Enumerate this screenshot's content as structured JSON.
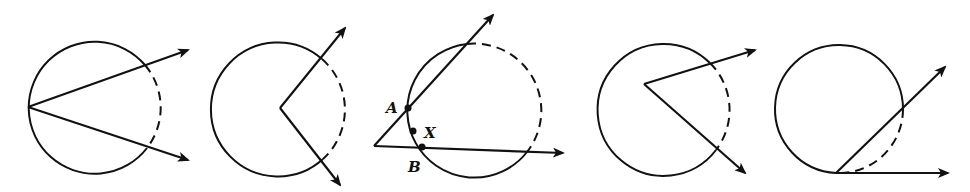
{
  "figures": [
    {
      "id": "fig1",
      "description": "vertex on circle, two chords extended as rays, intercepted arc dashed",
      "circle": {
        "cx": 93,
        "cy": 107,
        "r": 66
      },
      "vertex": [
        28,
        107
      ],
      "rays": [
        [
          188,
          50
        ],
        [
          188,
          160
        ]
      ],
      "dashed_arc": {
        "from": [
          145,
          65
        ],
        "to": [
          147,
          148
        ],
        "sweep": 1,
        "large": 0
      },
      "solid_arc": {
        "from": [
          147,
          148
        ],
        "to": [
          145,
          65
        ],
        "sweep": 1,
        "large": 1
      },
      "labels": []
    },
    {
      "id": "fig2",
      "description": "vertex at center-ish inside circle, rays exit right, intercepted arc dashed",
      "circle": {
        "cx": 279,
        "cy": 109,
        "r": 67
      },
      "vertex": [
        280,
        108
      ],
      "rays": [
        [
          345,
          28
        ],
        [
          340,
          185
        ]
      ],
      "dashed_arc": {
        "from": [
          322,
          59
        ],
        "to": [
          323,
          159
        ],
        "sweep": 1,
        "large": 0
      },
      "solid_arc": {
        "from": [
          323,
          159
        ],
        "to": [
          322,
          59
        ],
        "sweep": 1,
        "large": 1
      },
      "labels": []
    },
    {
      "id": "fig3",
      "description": "vertex outside circle, two secants, far arc dashed, points A, X, B marked",
      "circle": {
        "cx": 477,
        "cy": 110,
        "r": 67
      },
      "vertex": [
        374,
        146
      ],
      "rays": [
        [
          493,
          15
        ],
        [
          563,
          153
        ]
      ],
      "dashed_arc": {
        "from": [
          467,
          44
        ],
        "to": [
          527,
          152
        ],
        "sweep": 1,
        "large": 0
      },
      "solid_arc": {
        "from": [
          527,
          152
        ],
        "to": [
          467,
          44
        ],
        "sweep": 1,
        "large": 1
      },
      "points": [
        {
          "name": "A",
          "x": 408,
          "y": 108,
          "lx": 386,
          "ly": 113
        },
        {
          "name": "X",
          "x": 413,
          "y": 131,
          "lx": 424,
          "ly": 138
        },
        {
          "name": "B",
          "x": 422,
          "y": 147,
          "lx": 408,
          "ly": 172
        }
      ]
    },
    {
      "id": "fig4",
      "description": "vertex inside circle off-center, rays exit right, intercepted arc dashed",
      "circle": {
        "cx": 663,
        "cy": 109,
        "r": 66
      },
      "vertex": [
        644,
        84
      ],
      "rays": [
        [
          755,
          50
        ],
        [
          745,
          173
        ]
      ],
      "dashed_arc": {
        "from": [
          710,
          63
        ],
        "to": [
          716,
          150
        ],
        "sweep": 1,
        "large": 0
      },
      "solid_arc": {
        "from": [
          716,
          150
        ],
        "to": [
          710,
          63
        ],
        "sweep": 1,
        "large": 1
      },
      "labels": []
    },
    {
      "id": "fig5",
      "description": "tangent-chord angle, vertex on circle, intercepted arc dashed",
      "circle": {
        "cx": 835,
        "cy": 109,
        "r": 64
      },
      "vertex": [
        836,
        173
      ],
      "rays": [
        [
          945,
          67
        ],
        [
          948,
          173
        ]
      ],
      "dashed_arc": {
        "from": [
          903,
          109
        ],
        "to": [
          836,
          173
        ],
        "sweep": 1,
        "large": 0
      },
      "solid_arc": {
        "from": [
          836,
          173
        ],
        "to": [
          903,
          109
        ],
        "sweep": 1,
        "large": 1
      },
      "labels": []
    }
  ],
  "text_labels": {
    "A": "A",
    "X": "X",
    "B": "B"
  },
  "style": {
    "stroke": "#111111",
    "background": "#ffffff"
  }
}
